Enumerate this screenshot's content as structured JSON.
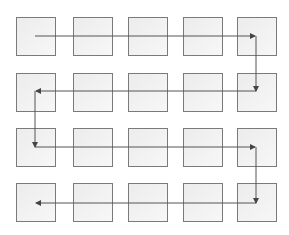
{
  "diagram": {
    "type": "grid-traversal",
    "rows": 4,
    "columns": 5,
    "cell_color": "#efefef",
    "border_color": "#7a7a7a",
    "arrow_color": "#555555",
    "column_x": [
      16,
      73,
      128,
      183,
      237
    ],
    "row_y": [
      17,
      73,
      128,
      183
    ],
    "path": [
      {
        "from": [
          0,
          0
        ],
        "to": [
          0,
          4
        ],
        "direction": "right"
      },
      {
        "from": [
          0,
          4
        ],
        "to": [
          1,
          4
        ],
        "direction": "down"
      },
      {
        "from": [
          1,
          4
        ],
        "to": [
          1,
          0
        ],
        "direction": "left"
      },
      {
        "from": [
          1,
          0
        ],
        "to": [
          2,
          0
        ],
        "direction": "down"
      },
      {
        "from": [
          2,
          0
        ],
        "to": [
          2,
          4
        ],
        "direction": "right"
      },
      {
        "from": [
          2,
          4
        ],
        "to": [
          3,
          4
        ],
        "direction": "down"
      },
      {
        "from": [
          3,
          4
        ],
        "to": [
          3,
          0
        ],
        "direction": "left"
      }
    ]
  }
}
